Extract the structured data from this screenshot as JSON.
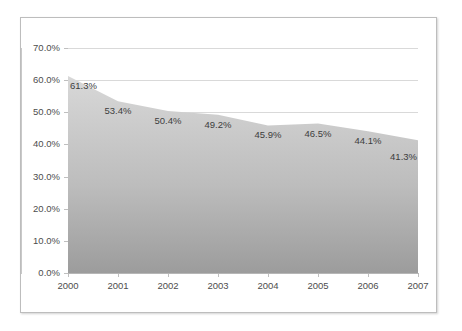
{
  "chart_data": {
    "type": "area",
    "title": "",
    "subtitle": "",
    "xlabel": "",
    "ylabel": "",
    "categories": [
      "2000",
      "2001",
      "2002",
      "2003",
      "2004",
      "2005",
      "2006",
      "2007"
    ],
    "values": [
      61.3,
      53.4,
      50.4,
      49.2,
      45.9,
      46.5,
      44.1,
      41.3
    ],
    "data_labels": [
      "61.3%",
      "53.4%",
      "50.4%",
      "49.2%",
      "45.9%",
      "46.5%",
      "44.1%",
      "41.3%"
    ],
    "ylim": [
      0,
      70
    ],
    "ytick_values": [
      70,
      60,
      50,
      40,
      30,
      20,
      10,
      0
    ],
    "ytick_labels": [
      "70.0%",
      "60.0%",
      "50.0%",
      "40.0%",
      "30.0%",
      "20.0%",
      "10.0%",
      "0.0%"
    ],
    "grid": "horizontal",
    "legend": "none",
    "series_name": "",
    "colors": {
      "area_fill_top": "#d6d6d6",
      "area_fill_bottom": "#9e9e9e",
      "gridline": "#d9d9d9",
      "axis": "#bfbfbf",
      "tick_text": "#4d4d4d",
      "label_text": "#3d3d3d",
      "frame_border": "#bdbdbd",
      "background": "#ffffff"
    }
  }
}
